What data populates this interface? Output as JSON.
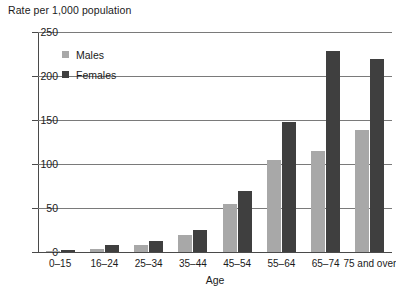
{
  "chart_data": {
    "type": "bar",
    "title": "Rate per 1,000 population",
    "xlabel": "Age",
    "ylabel": "Rate per 1,000 population",
    "categories": [
      "0–15",
      "16–24",
      "25–34",
      "35–44",
      "45–54",
      "55–64",
      "65–74",
      "75 and over"
    ],
    "series": [
      {
        "name": "Males",
        "values": [
          1,
          3,
          8,
          19,
          54,
          105,
          115,
          139
        ],
        "color": "#a8a8a8"
      },
      {
        "name": "Females",
        "values": [
          2,
          8,
          13,
          25,
          69,
          148,
          228,
          219
        ],
        "color": "#3f3f3f"
      }
    ],
    "ylim": [
      0,
      250
    ],
    "yticks": [
      0,
      50,
      100,
      150,
      200,
      250
    ],
    "ytick_labels": [
      "0",
      "50",
      "100",
      "150",
      "200",
      "250"
    ],
    "grid": true,
    "legend_position": "top-left-inside"
  },
  "colors": {
    "males": "#a8a8a8",
    "females": "#3f3f3f",
    "gridline": "#7a7a7a",
    "axis": "#4a4a4a",
    "text": "#1a1a1a",
    "background": "#ffffff"
  }
}
